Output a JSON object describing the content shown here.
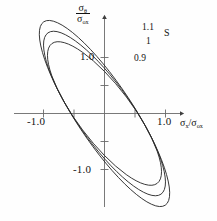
{
  "figure": {
    "background": "#fefefe",
    "curve_color": "#2b2b2b",
    "axis_color": "#4a4a4a"
  },
  "axes": {
    "y_axis_title_num": "σθ",
    "y_axis_title_den": "σox",
    "x_axis_title": "σx/σox",
    "x_tick_left": "-1.0",
    "x_tick_right": "1.0",
    "y_tick_top": "1.0",
    "y_tick_bottom": "-1.0"
  },
  "curve_labels": {
    "upper": "1.1",
    "middle": "1",
    "lower": "0.9",
    "series_symbol": "S"
  },
  "chart_data": {
    "type": "line",
    "title": "",
    "subtitle": "",
    "xlabel": "σx/σox",
    "ylabel": "σθ/σox",
    "xlim": [
      -1.45,
      1.45
    ],
    "ylim": [
      -1.75,
      1.75
    ],
    "grid": false,
    "legend_position": "inside-top-right",
    "legend_title": "S",
    "xticks": [
      -1.0,
      -0.5,
      0.5,
      1.0
    ],
    "xticklabels": [
      "-1.0",
      "",
      "",
      "1.0"
    ],
    "yticks": [
      -1.0,
      -0.5,
      0.5,
      1.0
    ],
    "yticklabels": [
      "-1.0",
      "",
      "",
      "1.0"
    ],
    "annotations": [
      {
        "text": "1.1",
        "x": 0.62,
        "y": 1.52
      },
      {
        "text": "S",
        "x": 0.98,
        "y": 1.46
      },
      {
        "text": "1",
        "x": 0.58,
        "y": 1.27
      },
      {
        "text": "0.9",
        "x": 0.46,
        "y": 1.03
      }
    ],
    "series": [
      {
        "name": "S = 1.1",
        "S": 1.1,
        "type": "tilted-ellipse",
        "passes_through": [
          [
            -1,
            0
          ],
          [
            1,
            0
          ]
        ],
        "semi_major": 1.92,
        "semi_minor": 0.46,
        "tilt_deg": 56.5,
        "points": [
          [
            1.0,
            0.0
          ],
          [
            1.08,
            0.33
          ],
          [
            1.12,
            0.66
          ],
          [
            1.1,
            0.99
          ],
          [
            1.0,
            1.3
          ],
          [
            0.82,
            1.5
          ],
          [
            0.58,
            1.58
          ],
          [
            0.33,
            1.55
          ],
          [
            0.08,
            1.43
          ],
          [
            -0.18,
            1.24
          ],
          [
            -0.43,
            1.0
          ],
          [
            -0.65,
            0.72
          ],
          [
            -0.84,
            0.44
          ],
          [
            -0.96,
            0.18
          ],
          [
            -1.0,
            0.0
          ],
          [
            -1.08,
            -0.33
          ],
          [
            -1.12,
            -0.66
          ],
          [
            -1.1,
            -0.99
          ],
          [
            -1.0,
            -1.3
          ],
          [
            -0.82,
            -1.5
          ],
          [
            -0.58,
            -1.58
          ],
          [
            -0.33,
            -1.55
          ],
          [
            -0.08,
            -1.43
          ],
          [
            0.18,
            -1.24
          ],
          [
            0.43,
            -1.0
          ],
          [
            0.65,
            -0.72
          ],
          [
            0.84,
            -0.44
          ],
          [
            0.96,
            -0.18
          ],
          [
            1.0,
            0.0
          ]
        ]
      },
      {
        "name": "S = 1",
        "S": 1.0,
        "type": "tilted-ellipse",
        "passes_through": [
          [
            -1,
            0
          ],
          [
            1,
            0
          ]
        ],
        "semi_major": 1.74,
        "semi_minor": 0.48,
        "tilt_deg": 55.0,
        "points": [
          [
            1.0,
            0.0
          ],
          [
            1.06,
            0.31
          ],
          [
            1.08,
            0.62
          ],
          [
            1.03,
            0.92
          ],
          [
            0.91,
            1.17
          ],
          [
            0.72,
            1.33
          ],
          [
            0.49,
            1.38
          ],
          [
            0.25,
            1.33
          ],
          [
            0.01,
            1.21
          ],
          [
            -0.24,
            1.04
          ],
          [
            -0.47,
            0.83
          ],
          [
            -0.68,
            0.6
          ],
          [
            -0.85,
            0.36
          ],
          [
            -0.96,
            0.15
          ],
          [
            -1.0,
            0.0
          ],
          [
            -1.06,
            -0.31
          ],
          [
            -1.08,
            -0.62
          ],
          [
            -1.03,
            -0.92
          ],
          [
            -0.91,
            -1.17
          ],
          [
            -0.72,
            -1.33
          ],
          [
            -0.49,
            -1.38
          ],
          [
            -0.25,
            -1.33
          ],
          [
            -0.01,
            -1.21
          ],
          [
            0.24,
            -1.04
          ],
          [
            0.47,
            -0.83
          ],
          [
            0.68,
            -0.6
          ],
          [
            0.85,
            -0.36
          ],
          [
            0.96,
            -0.15
          ],
          [
            1.0,
            0.0
          ]
        ]
      },
      {
        "name": "S = 0.9",
        "S": 0.9,
        "type": "tilted-ellipse",
        "passes_through": [
          [
            -1,
            0
          ],
          [
            1,
            0
          ]
        ],
        "semi_major": 1.55,
        "semi_minor": 0.5,
        "tilt_deg": 53.0,
        "points": [
          [
            1.0,
            0.0
          ],
          [
            1.04,
            0.29
          ],
          [
            1.03,
            0.57
          ],
          [
            0.95,
            0.83
          ],
          [
            0.8,
            1.02
          ],
          [
            0.61,
            1.14
          ],
          [
            0.39,
            1.17
          ],
          [
            0.16,
            1.12
          ],
          [
            -0.07,
            1.01
          ],
          [
            -0.3,
            0.86
          ],
          [
            -0.52,
            0.68
          ],
          [
            -0.71,
            0.49
          ],
          [
            -0.87,
            0.29
          ],
          [
            -0.97,
            0.12
          ],
          [
            -1.0,
            0.0
          ],
          [
            -1.04,
            -0.29
          ],
          [
            -1.03,
            -0.57
          ],
          [
            -0.95,
            -0.83
          ],
          [
            -0.8,
            -1.02
          ],
          [
            -0.61,
            -1.14
          ],
          [
            -0.39,
            -1.17
          ],
          [
            -0.16,
            -1.12
          ],
          [
            0.07,
            -1.01
          ],
          [
            0.3,
            -0.86
          ],
          [
            0.52,
            -0.68
          ],
          [
            0.71,
            -0.49
          ],
          [
            0.87,
            -0.29
          ],
          [
            0.97,
            -0.12
          ],
          [
            1.0,
            0.0
          ]
        ]
      }
    ]
  }
}
